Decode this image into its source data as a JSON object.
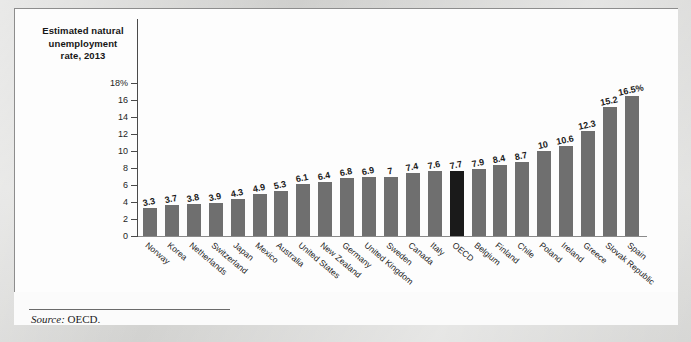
{
  "chart_title": "Estimated natural\nunemployment\nrate, 2013",
  "source": {
    "label": "Source:",
    "value": "OECD."
  },
  "chart_data": {
    "type": "bar",
    "xlabel": "",
    "ylabel": "",
    "ylim": [
      0,
      18
    ],
    "grid": false,
    "legend": "none",
    "y_ticks": [
      "0",
      "2",
      "4",
      "6",
      "8",
      "10",
      "12",
      "14",
      "16",
      "18%"
    ],
    "y_tick_values": [
      0,
      2,
      4,
      6,
      8,
      10,
      12,
      14,
      16,
      18
    ],
    "highlight_category": "OECD",
    "highlight_color": "#1a1a1a",
    "bar_color": "#6f6f6f",
    "categories": [
      "Norway",
      "Korea",
      "Netherlands",
      "Switzerland",
      "Japan",
      "Mexico",
      "Australia",
      "United States",
      "New Zealand",
      "Germany",
      "United Kingdom",
      "Sweden",
      "Canada",
      "Italy",
      "OECD",
      "Belgium",
      "Finland",
      "Chile",
      "Poland",
      "Ireland",
      "Greece",
      "Slovak Republic",
      "Spain"
    ],
    "values": [
      3.3,
      3.7,
      3.8,
      3.9,
      4.3,
      4.9,
      5.3,
      6.1,
      6.4,
      6.8,
      6.9,
      7,
      7.4,
      7.6,
      7.7,
      7.9,
      8.4,
      8.7,
      10,
      10.6,
      12.3,
      15.2,
      16.5
    ],
    "value_labels": [
      "3.3",
      "3.7",
      "3.8",
      "3.9",
      "4.3",
      "4.9",
      "5.3",
      "6.1",
      "6.4",
      "6.8",
      "6.9",
      "7",
      "7.4",
      "7.6",
      "7.7",
      "7.9",
      "8.4",
      "8.7",
      "10",
      "10.6",
      "12.3",
      "15.2",
      "16.5%"
    ]
  }
}
